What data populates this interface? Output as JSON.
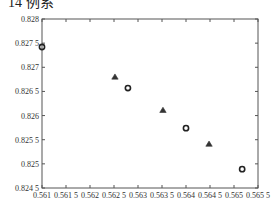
{
  "caption": "14 例系",
  "chart_data": {
    "type": "scatter",
    "title": "",
    "xlabel": "",
    "ylabel": "",
    "xlim": [
      0.561,
      0.5655
    ],
    "ylim": [
      0.8245,
      0.828
    ],
    "x_ticks": [
      "0.561",
      "0.561 5",
      "0.562",
      "0.562 5",
      "0.563",
      "0.563 5",
      "0.564",
      "0.564 5",
      "0.565",
      "0.565 5"
    ],
    "y_ticks": [
      "0.828",
      "0.827 5",
      "0.827",
      "0.826 5",
      "0.826",
      "0.825 5",
      "0.825",
      "0.824 5"
    ],
    "grid": false,
    "legend": null,
    "series": [
      {
        "name": "circles",
        "marker": "circle",
        "points": [
          {
            "x": 0.561,
            "y": 0.82742
          },
          {
            "x": 0.56279,
            "y": 0.82657
          },
          {
            "x": 0.564,
            "y": 0.82574
          },
          {
            "x": 0.56517,
            "y": 0.82489
          }
        ]
      },
      {
        "name": "triangles",
        "marker": "triangle",
        "points": [
          {
            "x": 0.56252,
            "y": 0.8268
          },
          {
            "x": 0.56352,
            "y": 0.82611
          },
          {
            "x": 0.56448,
            "y": 0.82541
          }
        ]
      }
    ]
  }
}
